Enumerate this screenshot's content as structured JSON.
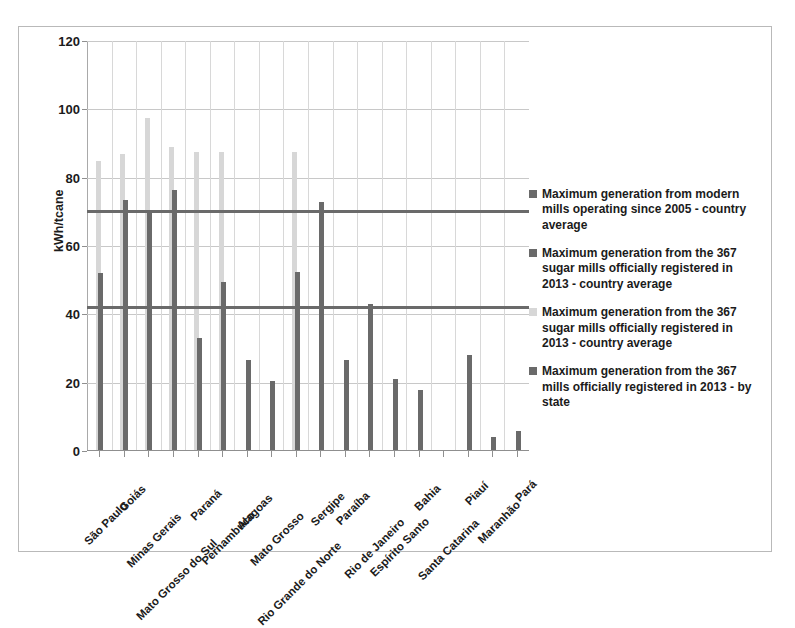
{
  "figure": {
    "y_axis_title": "kWh/tcane"
  },
  "legend": {
    "entries": [
      {
        "label": "Maximum generation from modern mills operating since 2005 - country average",
        "color": "#6a6a6a"
      },
      {
        "label": "Maximum generation from the 367 sugar mills officially registered  in 2013 - country average",
        "color": "#6a6a6a"
      },
      {
        "label": "Maximum generation from the 367 sugar mills officially registered  in 2013 - country average",
        "color": "#d7d7d7"
      },
      {
        "label": "Maximum generation from the 367 mills officially registered in 2013 - by state",
        "color": "#6a6a6a"
      }
    ]
  },
  "chart_data": {
    "type": "bar",
    "title": "",
    "xlabel": "",
    "ylabel": "kWh/tcane",
    "ylim": [
      0,
      120
    ],
    "yticks": [
      0,
      20,
      40,
      60,
      80,
      100,
      120
    ],
    "ytick_labels": [
      "0",
      "20",
      "40",
      "60",
      "80",
      "100",
      "120"
    ],
    "grid": true,
    "legend_position": "right",
    "categories": [
      "São Paulo",
      "Goiás",
      "Minas Gerais",
      "Mato Grosso do Sul",
      "Paraná",
      "Pernambuco",
      "Alagoas",
      "Mato Grosso",
      "Rio Grande do Norte",
      "Sergipe",
      "Paraíba",
      "Rio de Janeiro",
      "Espírito Santo",
      "Bahia",
      "Santa Catarina",
      "Piauí",
      "Maranhão",
      "Pará"
    ],
    "series": [
      {
        "name": "Maximum generation from the 367 sugar mills officially registered  in 2013 - country average",
        "color": "#d7d7d7",
        "values": [
          85,
          87,
          97.5,
          89,
          87.5,
          87.5,
          0,
          0,
          87.5,
          0,
          0,
          0,
          0,
          0,
          0,
          0,
          0,
          0
        ]
      },
      {
        "name": "Maximum generation from the 367 mills officially registered in 2013 - by state",
        "color": "#6a6a6a",
        "values": [
          52,
          73.5,
          70,
          76.5,
          33,
          49.5,
          26.5,
          20.5,
          52.5,
          73,
          26.5,
          43,
          21,
          18,
          0,
          28,
          4,
          6
        ]
      }
    ],
    "reference_lines": [
      {
        "label": "Maximum generation from modern mills operating since 2005 - country average",
        "value": 70,
        "color": "#6a6a6a"
      },
      {
        "label": "Maximum generation from the 367 sugar mills officially registered  in 2013 - country average",
        "value": 42,
        "color": "#6a6a6a"
      }
    ]
  }
}
